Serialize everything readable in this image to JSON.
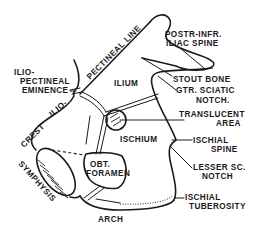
{
  "figure": {
    "ink_color": "#1a1a1a",
    "background": "#ffffff"
  },
  "labels": {
    "pectineal_line": "PECTINEAL LINE",
    "ilio_pectineal_eminence": [
      "ILIO-",
      "PECTINEAL",
      "EMINENCE"
    ],
    "ilio": "ILIO-",
    "crest": "CREST",
    "symphysis": "SYMPHYSIS",
    "arch": "ARCH",
    "ilium": "ILIUM",
    "ischium": "ISCHIUM",
    "obt_foramen": [
      "OBT.",
      "FORAMEN"
    ],
    "postr_infr_iliac_spine": [
      "POSTR-INFR.",
      "ILIAC SPINE"
    ],
    "stout_bone": "STOUT BONE",
    "gtr_sciatic_notch": [
      "GTR. SCIATIC",
      "NOTCH."
    ],
    "translucent_area": [
      "TRANSLUCENT",
      "AREA"
    ],
    "ischial_spine": [
      "ISCHIAL",
      "SPINE"
    ],
    "lesser_sc_notch": [
      "LESSER SC.",
      "NOTCH"
    ],
    "ischial_tuberosity": [
      "ISCHIAL",
      "TUBEROSITY"
    ]
  }
}
